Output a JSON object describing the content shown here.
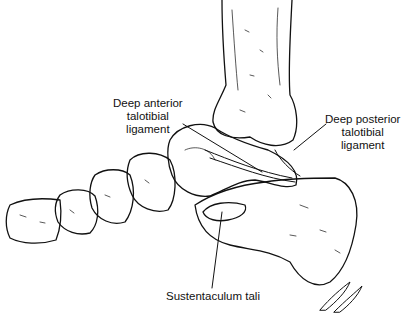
{
  "figure": {
    "labels": [
      {
        "id": "deep-anterior-talotibial-ligament",
        "lines": [
          "Deep anterior",
          "talotibial",
          "ligament"
        ]
      },
      {
        "id": "deep-posterior-talotibial-ligament",
        "lines": [
          "Deep posterior",
          "talotibial",
          "ligament"
        ]
      },
      {
        "id": "sustentaculum-tali",
        "lines": [
          "Sustentaculum tali"
        ]
      }
    ],
    "signature": "JJ"
  }
}
